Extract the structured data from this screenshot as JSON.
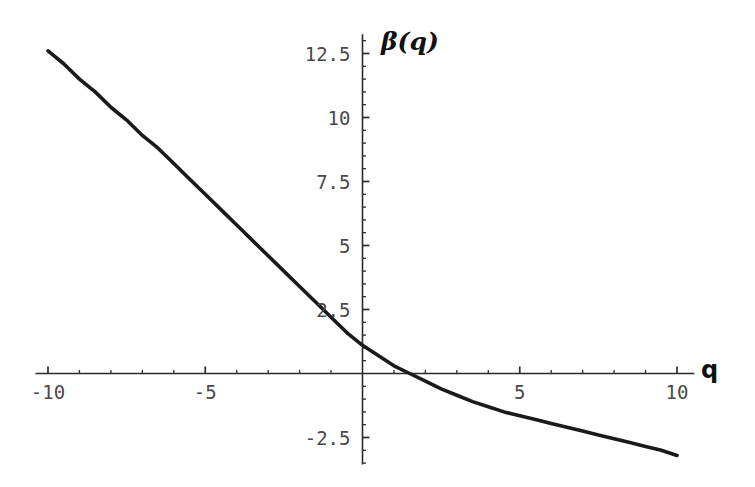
{
  "chart_data": {
    "type": "line",
    "title": "",
    "subtitle": "",
    "xlabel": "q",
    "ylabel": "β(q)",
    "xlim": [
      -10.5,
      10.5
    ],
    "ylim": [
      -3.6,
      13.2
    ],
    "grid": false,
    "legend": null,
    "x_ticks_major": [
      -10,
      -5,
      5,
      10
    ],
    "x_tick_labels": [
      "-10",
      "-5",
      "5",
      "10"
    ],
    "x_minor_step": 1,
    "y_ticks_major": [
      12.5,
      10,
      7.5,
      5,
      2.5,
      -2.5
    ],
    "y_tick_labels": [
      "12.5",
      "10",
      "7.5",
      "5",
      "2.5",
      "-2.5"
    ],
    "y_minor_step": 0.5,
    "series": [
      {
        "name": "beta(q)",
        "color": "#1a1a1a",
        "line_width": 3.6,
        "x": [
          -10,
          -9.5,
          -9,
          -8.5,
          -8,
          -7.5,
          -7,
          -6.5,
          -6,
          -5.5,
          -5,
          -4.5,
          -4,
          -3.5,
          -3,
          -2.5,
          -2,
          -1.5,
          -1,
          -0.5,
          0,
          0.5,
          1,
          1.5,
          2,
          2.5,
          3,
          3.5,
          4,
          4.5,
          5,
          5.5,
          6,
          6.5,
          7,
          7.5,
          8,
          8.5,
          9,
          9.5,
          10
        ],
        "values": [
          12.6,
          12.1,
          11.5,
          11.0,
          10.4,
          9.9,
          9.3,
          8.8,
          8.2,
          7.6,
          7.0,
          6.4,
          5.8,
          5.2,
          4.6,
          4.0,
          3.4,
          2.8,
          2.2,
          1.6,
          1.1,
          0.7,
          0.3,
          0.0,
          -0.3,
          -0.6,
          -0.85,
          -1.1,
          -1.3,
          -1.5,
          -1.65,
          -1.8,
          -1.95,
          -2.1,
          -2.25,
          -2.4,
          -2.55,
          -2.7,
          -2.85,
          -3.0,
          -3.2
        ]
      }
    ],
    "zero_crossing_x": 1.45,
    "y_intercept": 1.1,
    "annotations": []
  },
  "axes": {
    "x_label": "q",
    "y_label": "β(q)"
  },
  "labels": {
    "x": [
      {
        "text": "-10",
        "value": -10
      },
      {
        "text": "-5",
        "value": -5
      },
      {
        "text": "5",
        "value": 5
      },
      {
        "text": "10",
        "value": 10
      }
    ],
    "y": [
      {
        "text": "12.5",
        "value": 12.5
      },
      {
        "text": "10",
        "value": 10
      },
      {
        "text": "7.5",
        "value": 7.5
      },
      {
        "text": "5",
        "value": 5
      },
      {
        "text": "2.5",
        "value": 2.5
      },
      {
        "text": "-2.5",
        "value": -2.5
      }
    ]
  },
  "style": {
    "background": "#ffffff",
    "axis_color": "#2b2b2b",
    "curve_color": "#1a1a1a",
    "tick_label_color": "#4a4a4a"
  }
}
